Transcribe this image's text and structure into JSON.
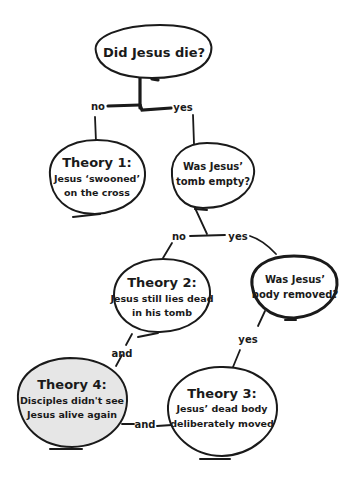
{
  "diagram": {
    "type": "flowchart",
    "colors": {
      "stroke": "#1a1a1a",
      "background": "#ffffff",
      "highlight_fill": "#e6e6e6"
    },
    "nodes": {
      "root": {
        "text": "Did Jesus die?"
      },
      "theory1": {
        "title": "Theory 1:",
        "line1": "Jesus ‘swooned’",
        "line2": "on the cross"
      },
      "tomb_empty": {
        "line1": "Was Jesus’",
        "line2": "tomb empty?"
      },
      "theory2": {
        "title": "Theory 2:",
        "line1": "Jesus still lies dead",
        "line2": "in his tomb"
      },
      "body_removed": {
        "line1": "Was Jesus’",
        "line2": "body removed?"
      },
      "theory3": {
        "title": "Theory 3:",
        "line1": "Jesus’ dead body",
        "line2": "deliberately moved"
      },
      "theory4": {
        "title": "Theory 4:",
        "line1": "Disciples didn't see",
        "line2": "Jesus alive again"
      }
    },
    "edges": {
      "root_no": "no",
      "root_yes": "yes",
      "tomb_no": "no",
      "tomb_yes": "yes",
      "removed_yes": "yes",
      "theory2_and": "and",
      "theory3_and": "and"
    }
  }
}
